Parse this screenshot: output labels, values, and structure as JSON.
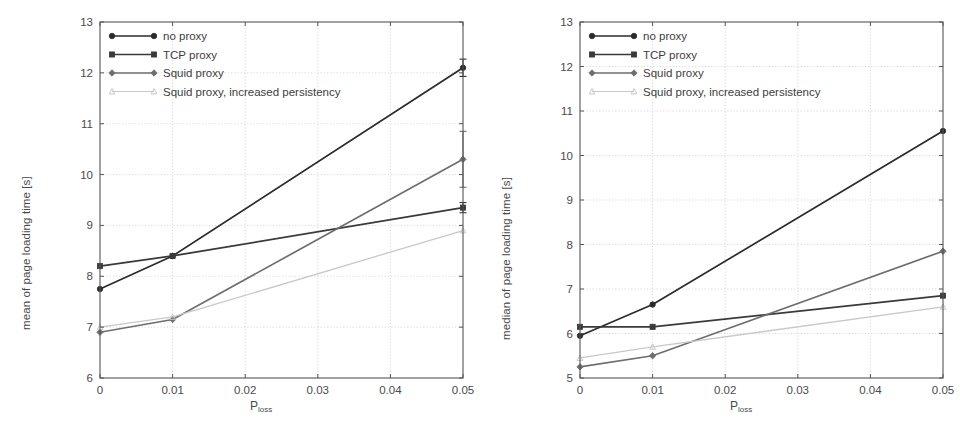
{
  "figure": {
    "panels": [
      {
        "id": "left",
        "ylabel": "mean of page loading time [s]",
        "xlabel_main": "P",
        "xlabel_sub": "loss"
      },
      {
        "id": "right",
        "ylabel": "median of page loading time [s]",
        "xlabel_main": "P",
        "xlabel_sub": "loss"
      }
    ]
  },
  "legend": {
    "items": [
      {
        "label": "no proxy",
        "marker": "circle",
        "color": "#2b2b2b"
      },
      {
        "label": "TCP proxy",
        "marker": "square",
        "color": "#3a3a3a"
      },
      {
        "label": "Squid proxy",
        "marker": "diamond",
        "color": "#6e6e6e"
      },
      {
        "label": "Squid proxy, increased persistency",
        "marker": "triangle",
        "color": "#c8c8c8"
      }
    ]
  },
  "chart_data": [
    {
      "type": "line",
      "title": "",
      "xlabel": "P_loss",
      "ylabel": "mean of page loading time [s]",
      "x": [
        0,
        0.01,
        0.05
      ],
      "xlim": [
        0,
        0.05
      ],
      "ylim": [
        6,
        13
      ],
      "xticks": [
        0,
        0.01,
        0.02,
        0.03,
        0.04,
        0.05
      ],
      "xticklabels": [
        "0",
        "0.01",
        "0.02",
        "0.03",
        "0.04",
        "0.05"
      ],
      "yticks": [
        6,
        7,
        8,
        9,
        10,
        11,
        12,
        13
      ],
      "yticklabels": [
        "6",
        "7",
        "8",
        "9",
        "10",
        "11",
        "12",
        "13"
      ],
      "grid": true,
      "legend_position": "upper left",
      "series": [
        {
          "name": "no proxy",
          "marker": "circle",
          "color": "#2b2b2b",
          "values": [
            7.75,
            8.4,
            12.1
          ],
          "errors": [
            0,
            0,
            0.17
          ]
        },
        {
          "name": "TCP proxy",
          "marker": "square",
          "color": "#3a3a3a",
          "values": [
            8.2,
            8.4,
            9.35
          ],
          "errors": [
            0,
            0,
            0.1
          ]
        },
        {
          "name": "Squid proxy",
          "marker": "diamond",
          "color": "#6e6e6e",
          "values": [
            6.9,
            7.15,
            10.3
          ],
          "errors": [
            0,
            0,
            0.55
          ]
        },
        {
          "name": "Squid proxy, increased persistency",
          "marker": "triangle",
          "color": "#c8c8c8",
          "values": [
            7.0,
            7.2,
            8.9
          ],
          "errors": [
            0,
            0,
            0
          ]
        }
      ]
    },
    {
      "type": "line",
      "title": "",
      "xlabel": "P_loss",
      "ylabel": "median of page loading time [s]",
      "x": [
        0,
        0.01,
        0.05
      ],
      "xlim": [
        0,
        0.05
      ],
      "ylim": [
        5,
        13
      ],
      "xticks": [
        0,
        0.01,
        0.02,
        0.03,
        0.04,
        0.05
      ],
      "xticklabels": [
        "0",
        "0.01",
        "0.02",
        "0.03",
        "0.04",
        "0.05"
      ],
      "yticks": [
        5,
        6,
        7,
        8,
        9,
        10,
        11,
        12,
        13
      ],
      "yticklabels": [
        "5",
        "6",
        "7",
        "8",
        "9",
        "10",
        "11",
        "12",
        "13"
      ],
      "grid": true,
      "legend_position": "upper left",
      "series": [
        {
          "name": "no proxy",
          "marker": "circle",
          "color": "#2b2b2b",
          "values": [
            5.95,
            6.65,
            10.55
          ],
          "errors": [
            0,
            0,
            0
          ]
        },
        {
          "name": "TCP proxy",
          "marker": "square",
          "color": "#3a3a3a",
          "values": [
            6.15,
            6.15,
            6.85
          ],
          "errors": [
            0,
            0,
            0
          ]
        },
        {
          "name": "Squid proxy",
          "marker": "diamond",
          "color": "#6e6e6e",
          "values": [
            5.25,
            5.5,
            7.85
          ],
          "errors": [
            0,
            0,
            0
          ]
        },
        {
          "name": "Squid proxy, increased persistency",
          "marker": "triangle",
          "color": "#c8c8c8",
          "values": [
            5.45,
            5.7,
            6.6
          ],
          "errors": [
            0,
            0,
            0
          ]
        }
      ]
    }
  ]
}
